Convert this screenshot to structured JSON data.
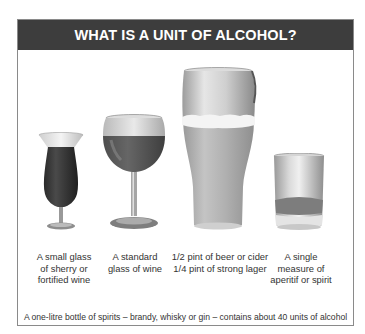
{
  "title": "WHAT IS A UNIT OF ALCOHOL?",
  "colors": {
    "header_bg": "#3d3d3d",
    "header_text": "#ffffff",
    "border": "#8a8a8a",
    "text": "#333333"
  },
  "items": [
    {
      "icon": "sherry-glass-icon",
      "label": "A small glass\nof sherry or\nfortified wine"
    },
    {
      "icon": "wine-glass-icon",
      "label": "A standard\nglass of wine"
    },
    {
      "icon": "beer-pint-glass-icon",
      "label": "1/2 pint of beer or cider\n1/4 pint of strong lager"
    },
    {
      "icon": "spirit-tumbler-icon",
      "label": "A single\nmeasure of\naperitif or spirit"
    }
  ],
  "footer": "A one-litre bottle of spirits – brandy, whisky or gin – contains about 40 units of alcohol"
}
